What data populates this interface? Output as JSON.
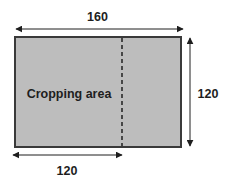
{
  "diagram": {
    "area_label": "Cropping area",
    "top_dimension": "160",
    "right_dimension": "120",
    "bottom_dimension": "120",
    "colors": {
      "fill": "#bdbdbd",
      "stroke": "#3a3a3a",
      "text": "#1e1e1e"
    }
  }
}
